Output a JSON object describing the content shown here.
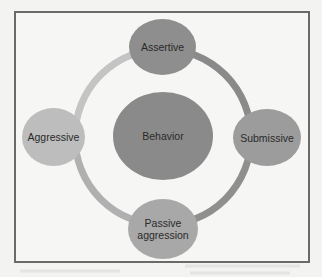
{
  "diagram": {
    "center": {
      "label": "Behavior",
      "color": "#8a8a8a"
    },
    "nodes": [
      {
        "id": "assertive",
        "label": "Assertive",
        "position": "top",
        "color": "#8e8e8e"
      },
      {
        "id": "submissive",
        "label": "Submissive",
        "position": "right",
        "color": "#9c9c9c"
      },
      {
        "id": "passive-aggression",
        "label": "Passive aggression",
        "line1": "Passive",
        "line2": "aggression",
        "position": "bottom",
        "color": "#a8a8a8"
      },
      {
        "id": "aggressive",
        "label": "Aggressive",
        "position": "left",
        "color": "#bdbdbd"
      }
    ],
    "ring_colors": {
      "top_right": "#8a8a8a",
      "bottom_right": "#8f8f8f",
      "bottom_left": "#b0b0b0",
      "top_left": "#c4c4c4"
    }
  }
}
